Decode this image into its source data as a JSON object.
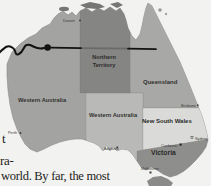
{
  "document": {
    "fragments": {
      "frag1": "t",
      "frag2": "ra-",
      "bottom_line": "world. By far, the most"
    }
  },
  "map": {
    "regions": {
      "western_australia": "Western Australia",
      "northern_territory_line1": "Northern",
      "northern_territory_line2": "Territory",
      "south_australia_label": "Western Australia",
      "queensland": "Queensland",
      "new_south_wales": "New South Wales",
      "victoria": "Victoria"
    },
    "cities": {
      "darwin": "Darwin",
      "perth": "Perth",
      "adelaide": "Adelaide",
      "brisbane": "Brisbane",
      "sydney": "Sydney",
      "canberra": "Canberra",
      "melbourne": "Melbourne"
    },
    "colors": {
      "page_bg": "#f2f2f0",
      "wa": "#a3a3a1",
      "nt": "#858583",
      "sa": "#b9b9b7",
      "qld": "#a8a8a6",
      "nsw": "#dadad8",
      "vic": "#8e8e8c",
      "tas": "#8a8a88",
      "islands": "#767674",
      "label_dark": "#32322f",
      "city_dark": "#3a3a38",
      "ink": "#121212"
    }
  }
}
